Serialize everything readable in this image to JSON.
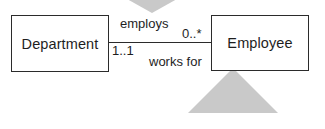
{
  "diagram": {
    "type": "uml-class-association",
    "background_color": "#ffffff",
    "line_color": "#2b2b2b",
    "watermark_color": "#c9c9c9",
    "classes": [
      {
        "id": "department",
        "name": "Department"
      },
      {
        "id": "employee",
        "name": "Employee"
      }
    ],
    "association": {
      "forward_label": "employs",
      "reverse_label": "works for",
      "source_multiplicity": "1..1",
      "target_multiplicity": "0..*"
    },
    "watermarks": [
      {
        "id": "watermark-triangle-top",
        "direction": "down"
      },
      {
        "id": "watermark-triangle-bottom",
        "direction": "up"
      }
    ]
  }
}
